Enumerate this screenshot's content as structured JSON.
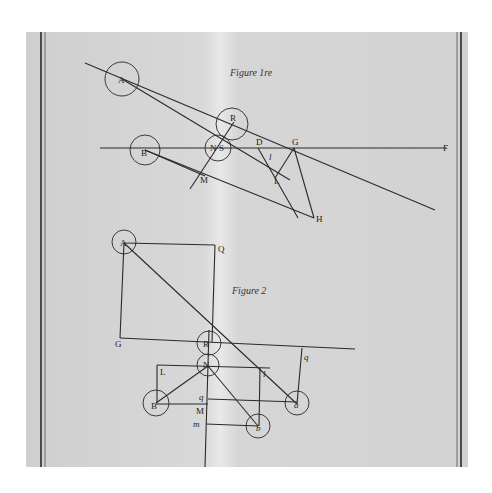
{
  "figure1": {
    "title": "Figure 1re",
    "labels": {
      "A": "A",
      "R": "R",
      "N": "N",
      "S": "S",
      "B": "B",
      "D": "D",
      "G": "G",
      "F": "F",
      "l": "l",
      "L": "L",
      "M": "M",
      "H": "H"
    }
  },
  "figure2": {
    "title": "Figure 2",
    "labels": {
      "A": "A",
      "Q": "Q",
      "G": "G",
      "R": "R",
      "N": "N",
      "L": "L",
      "l": "l",
      "q_right": "q",
      "q_mid": "q",
      "M": "M",
      "m": "m",
      "B": "B",
      "b": "b",
      "a": "a"
    }
  },
  "colors": {
    "paper": "#d4d4d4",
    "ink": "#2a2a2a"
  }
}
